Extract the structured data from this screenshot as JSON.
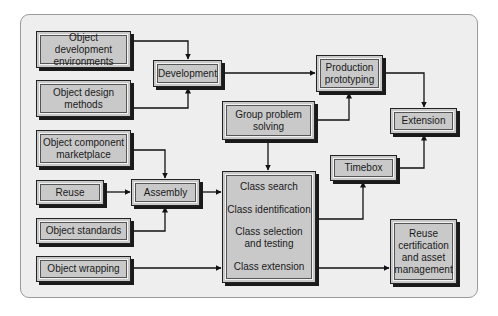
{
  "diagram": {
    "nodes": [
      {
        "id": "obj-dev-env",
        "label": "Object development\nenvironments"
      },
      {
        "id": "obj-design",
        "label": "Object design\nmethods"
      },
      {
        "id": "obj-component",
        "label": "Object component\nmarketplace"
      },
      {
        "id": "reuse",
        "label": "Reuse"
      },
      {
        "id": "obj-standards",
        "label": "Object standards"
      },
      {
        "id": "obj-wrapping",
        "label": "Object wrapping"
      },
      {
        "id": "development",
        "label": "Development"
      },
      {
        "id": "assembly",
        "label": "Assembly"
      },
      {
        "id": "group-problem",
        "label": "Group problem\nsolving"
      },
      {
        "id": "production-proto",
        "label": "Production\nprototyping"
      },
      {
        "id": "extension",
        "label": "Extension"
      },
      {
        "id": "timebox",
        "label": "Timebox"
      },
      {
        "id": "reuse-cert",
        "label": "Reuse\ncertification\nand asset\nmanagement"
      }
    ],
    "class_box": {
      "items": [
        "Class search",
        "Class identification",
        "Class selection\nand testing",
        "Class extension"
      ]
    },
    "edges": [
      {
        "from": "Object development environments",
        "to": "Development"
      },
      {
        "from": "Object design methods",
        "to": "Development"
      },
      {
        "from": "Development",
        "to": "Production prototyping"
      },
      {
        "from": "Group problem solving",
        "to": "Production prototyping"
      },
      {
        "from": "Group problem solving",
        "to": "Class box"
      },
      {
        "from": "Production prototyping",
        "to": "Extension"
      },
      {
        "from": "Timebox",
        "to": "Extension"
      },
      {
        "from": "Class box",
        "to": "Timebox"
      },
      {
        "from": "Object component marketplace",
        "to": "Assembly"
      },
      {
        "from": "Reuse",
        "to": "Assembly"
      },
      {
        "from": "Object standards",
        "to": "Assembly"
      },
      {
        "from": "Assembly",
        "to": "Class box"
      },
      {
        "from": "Object wrapping",
        "to": "Class box"
      },
      {
        "from": "Class box",
        "to": "Reuse certification and asset management"
      }
    ]
  }
}
